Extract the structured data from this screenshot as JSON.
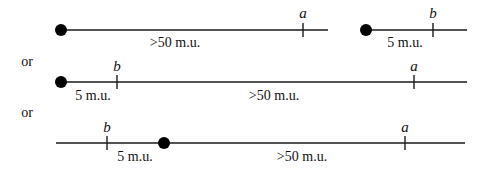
{
  "diagram": {
    "connector_label": "or",
    "rows": [
      {
        "id": "row-1",
        "segments": [
          {
            "line": {
              "x1": 61,
              "x2": 328,
              "y": 30
            },
            "dot": {
              "cx": 61,
              "cy": 30,
              "r": 6
            },
            "ticks": [
              {
                "x": 303,
                "label": "a"
              }
            ],
            "distance_label": {
              "text": ">50 m.u.",
              "x": 175,
              "y": 46
            }
          },
          {
            "line": {
              "x1": 366,
              "x2": 467,
              "y": 30
            },
            "dot": {
              "cx": 366,
              "cy": 30,
              "r": 6
            },
            "ticks": [
              {
                "x": 433,
                "label": "b"
              }
            ],
            "distance_label": {
              "text": "5 m.u.",
              "x": 405,
              "y": 46
            }
          }
        ]
      },
      {
        "id": "row-2",
        "or_label": {
          "text": "or",
          "x": 27,
          "y": 66
        },
        "segments": [
          {
            "line": {
              "x1": 61,
              "x2": 467,
              "y": 82
            },
            "dot": {
              "cx": 61,
              "cy": 82,
              "r": 6
            },
            "ticks": [
              {
                "x": 117,
                "label": "b"
              },
              {
                "x": 414,
                "label": "a"
              }
            ],
            "distance_labels": [
              {
                "text": "5 m.u.",
                "x": 93,
                "y": 99
              },
              {
                "text": ">50 m.u.",
                "x": 274,
                "y": 99
              }
            ]
          }
        ]
      },
      {
        "id": "row-3",
        "or_label": {
          "text": "or",
          "x": 27,
          "y": 117
        },
        "segments": [
          {
            "line": {
              "x1": 56,
              "x2": 465,
              "y": 143
            },
            "dot": {
              "cx": 164,
              "cy": 143,
              "r": 6
            },
            "ticks": [
              {
                "x": 107,
                "label": "b"
              },
              {
                "x": 405,
                "label": "a"
              }
            ],
            "distance_labels": [
              {
                "text": "5 m.u.",
                "x": 135,
                "y": 160
              },
              {
                "text": ">50 m.u.",
                "x": 302,
                "y": 160
              }
            ]
          }
        ]
      }
    ]
  },
  "text": {
    "or_1": "or",
    "or_2": "or",
    "a": "a",
    "b": "b",
    "far": ">50 m.u.",
    "near": "5 m.u."
  }
}
